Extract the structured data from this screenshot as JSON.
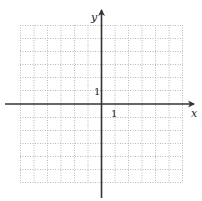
{
  "diagram": {
    "type": "coordinate-grid",
    "axes": {
      "x_label": "x",
      "y_label": "y",
      "x_tick_label": "1",
      "y_tick_label": "1"
    },
    "grid": {
      "columns": 12,
      "rows": 12,
      "style": "dotted",
      "x_range": [
        -7,
        5
      ],
      "y_range": [
        -6,
        6
      ]
    },
    "colors": {
      "axis": "#333333",
      "grid": "#b8b8b8",
      "background": "#ffffff"
    }
  }
}
